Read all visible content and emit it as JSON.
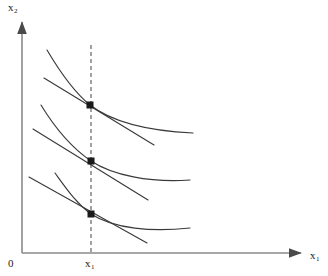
{
  "figure": {
    "type": "economics-indifference-curve-diagram",
    "background_color": "#ffffff",
    "stroke_color": "#3a3a3a",
    "axis_color": "#7a7a7a",
    "point_color": "#1a1a1a",
    "dash_color": "#555555"
  },
  "axes": {
    "y_label": "x",
    "y_label_sub": "2",
    "x_label": "x",
    "x_label_sub": "1",
    "origin_label": "0",
    "x_tick_label": "x",
    "x_tick_label_sub": "1",
    "y_axis_x": 22,
    "x_axis_y": 253,
    "y_axis_top": 18,
    "x_axis_right": 305
  },
  "guide_line": {
    "name": "vertical-dashed-guide",
    "x": 91,
    "y_top": 45,
    "y_bottom": 253,
    "dash_pattern": "4,3"
  },
  "chart_data": {
    "type": "line",
    "title": "",
    "xlabel": "x1",
    "ylabel": "x2",
    "grid": false,
    "legend": null,
    "xlim": [
      22,
      305
    ],
    "ylim": [
      253,
      18
    ],
    "annotations": [
      {
        "text": "x1",
        "x": 91,
        "y": 264,
        "role": "x-tick-label"
      },
      {
        "text": "0",
        "x": 14,
        "y": 264,
        "role": "origin-label"
      },
      {
        "text": "x2",
        "x": 14,
        "y": 8,
        "role": "y-axis-label"
      },
      {
        "text": "x1",
        "x": 313,
        "y": 256,
        "role": "x-axis-label"
      }
    ],
    "tangency_points": [
      {
        "name": "tangency-point-top",
        "x": 90,
        "y": 105
      },
      {
        "name": "tangency-point-middle",
        "x": 91,
        "y": 161
      },
      {
        "name": "tangency-point-bottom",
        "x": 91,
        "y": 214
      }
    ],
    "series": [
      {
        "name": "indifference-curve-top",
        "kind": "curve",
        "path": "M 47 50 C 60 72, 74 92, 90 105 C 112 122, 150 131, 193 133"
      },
      {
        "name": "budget-line-top",
        "kind": "line",
        "x1": 44,
        "y1": 78,
        "x2": 154,
        "y2": 145
      },
      {
        "name": "indifference-curve-middle",
        "kind": "curve",
        "path": "M 41 105 C 55 128, 72 148, 91 161 C 112 175, 150 183, 190 180"
      },
      {
        "name": "budget-line-middle",
        "kind": "line",
        "x1": 33,
        "y1": 129,
        "x2": 148,
        "y2": 200
      },
      {
        "name": "indifference-curve-bottom",
        "kind": "curve",
        "path": "M 55 173 C 66 188, 76 203, 91 214 C 114 229, 152 232, 190 228"
      },
      {
        "name": "budget-line-bottom",
        "kind": "line",
        "x1": 29,
        "y1": 177,
        "x2": 147,
        "y2": 243
      }
    ]
  }
}
